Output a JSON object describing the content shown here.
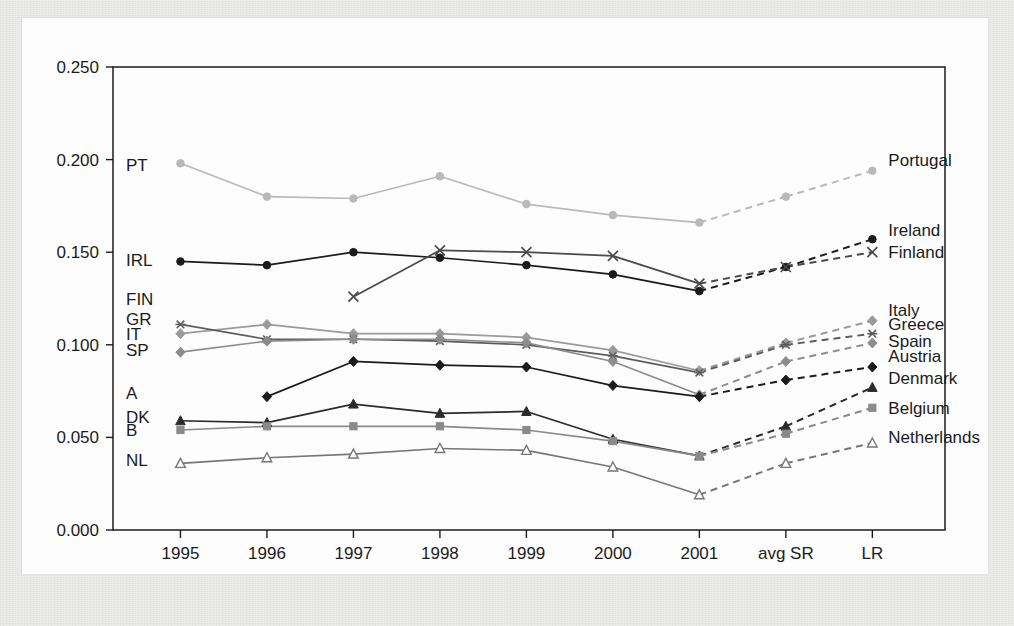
{
  "chart_data": {
    "type": "line",
    "title": "",
    "xlabel": "",
    "ylabel": "",
    "categories": [
      "1995",
      "1996",
      "1997",
      "1998",
      "1999",
      "2000",
      "2001",
      "avg SR",
      "LR"
    ],
    "ylim": [
      0.0,
      0.25
    ],
    "yticks": [
      "0.000",
      "0.050",
      "0.100",
      "0.150",
      "0.200",
      "0.250"
    ],
    "ytick_values": [
      0.0,
      0.05,
      0.1,
      0.15,
      0.2,
      0.25
    ],
    "grid": false,
    "legend_position": "right-inline",
    "note": "Solid segments cover 1995-2001; dashed segments connect 2001 to avg SR and LR projections.",
    "series": [
      {
        "name": "Portugal",
        "short_label": "PT",
        "right_label": "Portugal",
        "color": "#b9b9b9",
        "marker": "circle",
        "values": [
          0.198,
          0.18,
          0.179,
          0.191,
          0.176,
          0.17,
          0.166,
          0.18,
          0.194
        ]
      },
      {
        "name": "Ireland",
        "short_label": "IRL",
        "right_label": "Ireland",
        "color": "#1b1b1b",
        "marker": "circle",
        "values": [
          0.145,
          0.143,
          0.15,
          0.147,
          0.143,
          0.138,
          0.129,
          0.142,
          0.157
        ]
      },
      {
        "name": "Finland",
        "short_label": "FIN",
        "right_label": "Finland",
        "color": "#4a4a4a",
        "marker": "cross",
        "values": [
          null,
          null,
          0.126,
          0.151,
          0.15,
          0.148,
          0.133,
          0.142,
          0.15
        ]
      },
      {
        "name": "Italy",
        "short_label": "IT",
        "right_label": "Italy",
        "color": "#9a9a9a",
        "marker": "diamond",
        "values": [
          0.106,
          0.111,
          0.106,
          0.106,
          0.104,
          0.097,
          0.086,
          0.101,
          0.113
        ]
      },
      {
        "name": "Greece",
        "short_label": "GR",
        "right_label": "Greece",
        "color": "#5d5d5d",
        "marker": "star",
        "values": [
          0.111,
          0.103,
          0.103,
          0.102,
          0.1,
          0.094,
          0.085,
          0.1,
          0.106
        ]
      },
      {
        "name": "Spain",
        "short_label": "SP",
        "right_label": "Spain",
        "color": "#8c8c8c",
        "marker": "diamond",
        "values": [
          0.096,
          0.102,
          0.103,
          0.103,
          0.101,
          0.091,
          0.073,
          0.091,
          0.101
        ]
      },
      {
        "name": "Austria",
        "short_label": "A",
        "right_label": "Austria",
        "color": "#1b1b1b",
        "marker": "diamond",
        "values": [
          null,
          0.072,
          0.091,
          0.089,
          0.088,
          0.078,
          0.072,
          0.081,
          0.088
        ]
      },
      {
        "name": "Denmark",
        "short_label": "DK",
        "right_label": "Denmark",
        "color": "#2b2b2b",
        "marker": "triangle",
        "values": [
          0.059,
          0.058,
          0.068,
          0.063,
          0.064,
          0.049,
          0.04,
          0.056,
          0.077
        ]
      },
      {
        "name": "Belgium",
        "short_label": "B",
        "right_label": "Belgium",
        "color": "#8a8a8a",
        "marker": "square",
        "values": [
          0.054,
          0.056,
          0.056,
          0.056,
          0.054,
          0.048,
          0.04,
          0.052,
          0.066
        ]
      },
      {
        "name": "Netherlands",
        "short_label": "NL",
        "right_label": "Netherlands",
        "color": "#777777",
        "marker": "triangle-open",
        "values": [
          0.036,
          0.039,
          0.041,
          0.044,
          0.043,
          0.034,
          0.019,
          0.036,
          0.047
        ]
      }
    ],
    "left_annotations": [
      {
        "label": "PT",
        "y": 0.197
      },
      {
        "label": "IRL",
        "y": 0.146
      },
      {
        "label": "FIN",
        "y": 0.125
      },
      {
        "label": "GR",
        "y": 0.114
      },
      {
        "label": "IT",
        "y": 0.106
      },
      {
        "label": "SP",
        "y": 0.097
      },
      {
        "label": "A",
        "y": 0.074
      },
      {
        "label": "DK",
        "y": 0.061
      },
      {
        "label": "B",
        "y": 0.054
      },
      {
        "label": "NL",
        "y": 0.038
      }
    ]
  }
}
